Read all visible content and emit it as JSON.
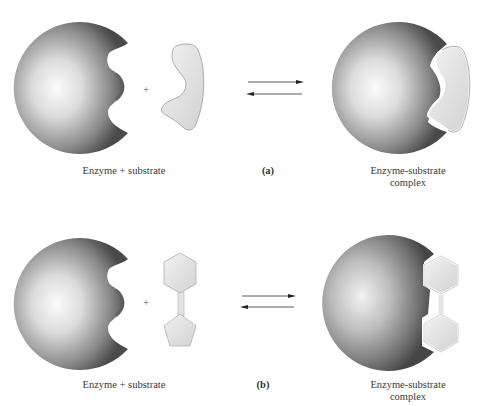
{
  "figure": {
    "panels": [
      {
        "id": "a",
        "panel_label": "(a)",
        "left_label": "Enzyme + substrate",
        "right_label_line1": "Enzyme-substrate",
        "right_label_line2": "complex",
        "plus_sign": "+",
        "substrate_shape": "curved-crescent"
      },
      {
        "id": "b",
        "panel_label": "(b)",
        "left_label": "Enzyme + substrate",
        "right_label_line1": "Enzyme-substrate",
        "right_label_line2": "complex",
        "plus_sign": "+",
        "substrate_shape": "hexagon-pentagon-linked"
      }
    ],
    "arrows": "equilibrium-double-arrow",
    "colors": {
      "enzyme_dark": "#3c3c3c",
      "enzyme_light": "#f4f4f4",
      "substrate_fill": "#e4e4e4",
      "substrate_stroke": "#9a9a9a"
    }
  }
}
